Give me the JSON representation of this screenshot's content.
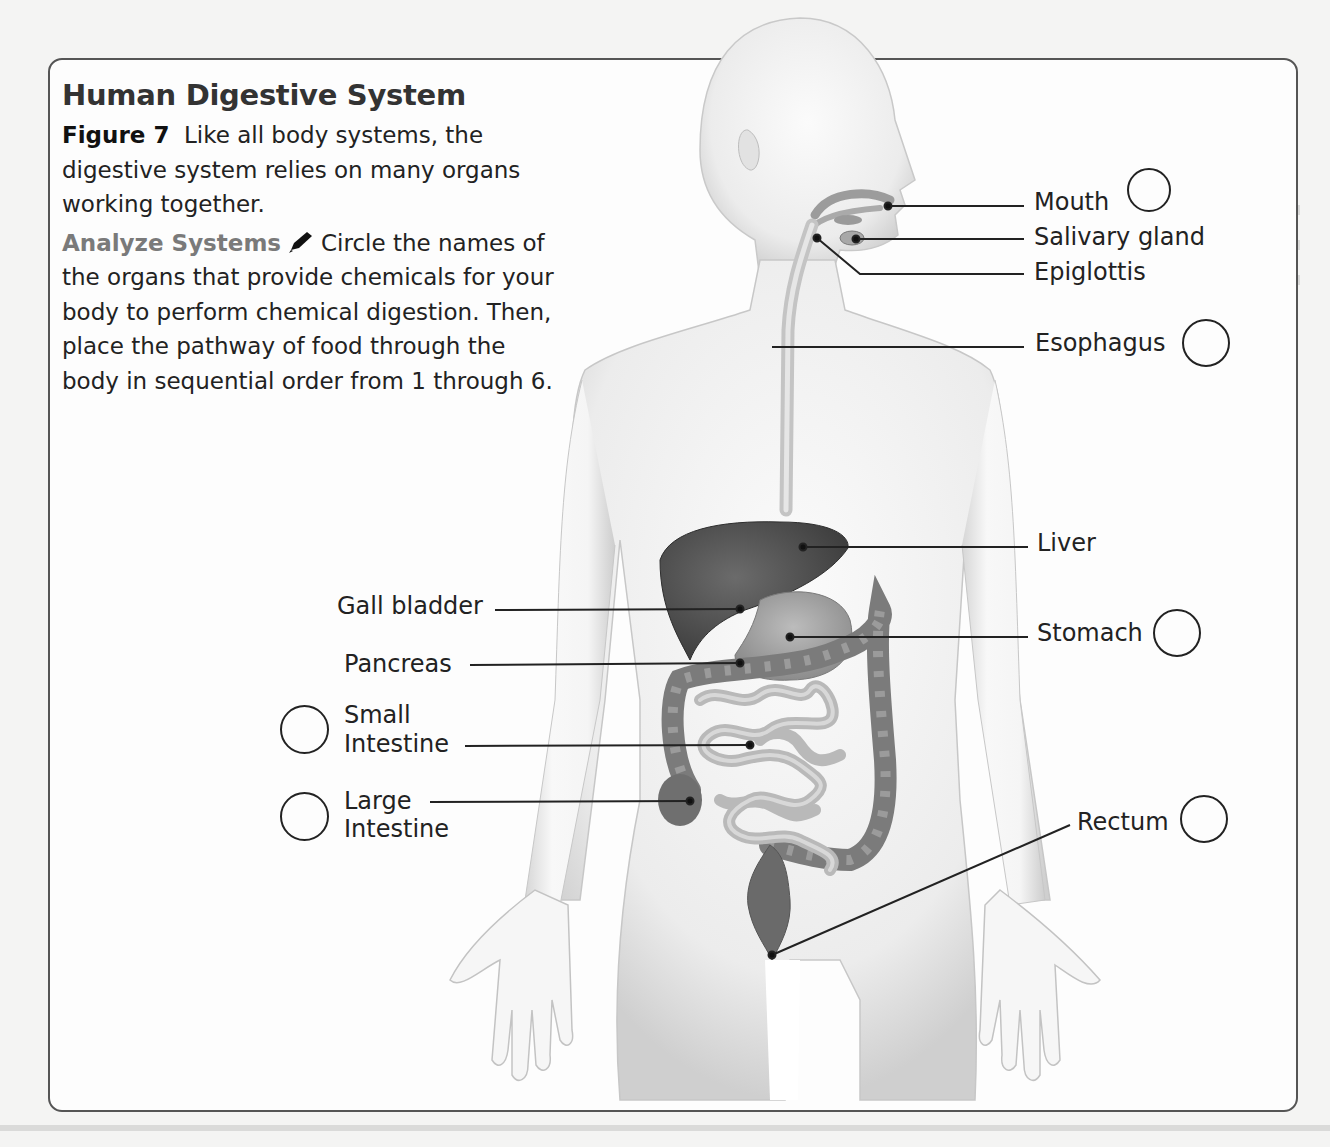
{
  "header": {
    "title": "Human Digestive System"
  },
  "caption": {
    "figure_label": "Figure 7",
    "figure_text": "Like all body systems, the digestive system relies on many organs working together.",
    "analyze_label": "Analyze Systems",
    "pencil_icon": "pencil-icon",
    "analyze_text": "Circle the names of the organs that provide chemicals for your body to perform chemical digestion. Then, place the pathway of food through the body in sequential order from 1 through 6."
  },
  "labels": {
    "mouth": "Mouth",
    "salivary_gland": "Salivary gland",
    "epiglottis": "Epiglottis",
    "esophagus": "Esophagus",
    "liver": "Liver",
    "stomach": "Stomach",
    "rectum": "Rectum",
    "gall_bladder": "Gall bladder",
    "pancreas": "Pancreas",
    "small_intestine_1": "Small",
    "small_intestine_2": "Intestine",
    "large_intestine_1": "Large",
    "large_intestine_2": "Intestine"
  },
  "answer_circles": [
    {
      "organ": "Mouth",
      "value": ""
    },
    {
      "organ": "Esophagus",
      "value": ""
    },
    {
      "organ": "Stomach",
      "value": ""
    },
    {
      "organ": "Rectum",
      "value": ""
    },
    {
      "organ": "Small Intestine",
      "value": ""
    },
    {
      "organ": "Large Intestine",
      "value": ""
    }
  ],
  "colors": {
    "border": "#555555",
    "title": "#333333",
    "analyze": "#7a7a7a",
    "organ_dark": "#4a4a4a",
    "organ_mid": "#8a8a8a",
    "organ_light": "#bdbdbd",
    "skin": "#f2f2f2"
  }
}
